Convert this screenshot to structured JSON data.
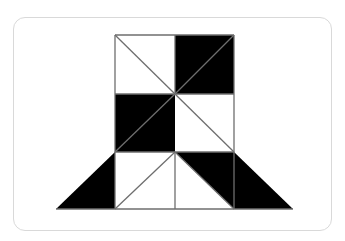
{
  "figure": {
    "colors": {
      "fill_dark": "#000000",
      "fill_light": "#ffffff",
      "stroke": "#6e6e6e",
      "card_border": "#d9d9d9"
    },
    "polygons": [
      {
        "name": "top-right-square",
        "fill": "#000000",
        "points": "175,35 234,35 234,94 175,94"
      },
      {
        "name": "middle-left-square",
        "fill": "#000000",
        "points": "115,94 175,94 175,152 115,152"
      },
      {
        "name": "bottom-left-triangle",
        "fill": "#000000",
        "points": "56,209 115,152 115,209"
      },
      {
        "name": "bottom-center-right-triangle",
        "fill": "#000000",
        "points": "175,152 234,152 234,209"
      },
      {
        "name": "bottom-right-triangle",
        "fill": "#000000",
        "points": "234,152 293,209 234,209"
      }
    ],
    "lines": [
      {
        "name": "outline-top",
        "x1": 115,
        "y1": 35,
        "x2": 234,
        "y2": 35
      },
      {
        "name": "outline-left",
        "x1": 115,
        "y1": 35,
        "x2": 115,
        "y2": 209
      },
      {
        "name": "outline-right",
        "x1": 234,
        "y1": 35,
        "x2": 234,
        "y2": 152
      },
      {
        "name": "mid-vertical-top",
        "x1": 175,
        "y1": 35,
        "x2": 175,
        "y2": 94
      },
      {
        "name": "mid-vertical-bottom",
        "x1": 175,
        "y1": 152,
        "x2": 175,
        "y2": 209
      },
      {
        "name": "row-line-1",
        "x1": 115,
        "y1": 94,
        "x2": 234,
        "y2": 94
      },
      {
        "name": "row-line-2",
        "x1": 115,
        "y1": 152,
        "x2": 234,
        "y2": 152
      },
      {
        "name": "base-line",
        "x1": 56,
        "y1": 209,
        "x2": 293,
        "y2": 209
      },
      {
        "name": "diag-top-left",
        "x1": 115,
        "y1": 35,
        "x2": 175,
        "y2": 94
      },
      {
        "name": "diag-top-right",
        "x1": 175,
        "y1": 94,
        "x2": 234,
        "y2": 35
      },
      {
        "name": "diag-mid-left",
        "x1": 115,
        "y1": 152,
        "x2": 175,
        "y2": 94
      },
      {
        "name": "diag-mid-right",
        "x1": 175,
        "y1": 94,
        "x2": 234,
        "y2": 152
      },
      {
        "name": "diag-bottom-left",
        "x1": 115,
        "y1": 209,
        "x2": 175,
        "y2": 152
      },
      {
        "name": "diag-bottom-right",
        "x1": 175,
        "y1": 152,
        "x2": 234,
        "y2": 209
      },
      {
        "name": "right-vertical-bottom",
        "x1": 234,
        "y1": 152,
        "x2": 234,
        "y2": 209
      }
    ]
  }
}
